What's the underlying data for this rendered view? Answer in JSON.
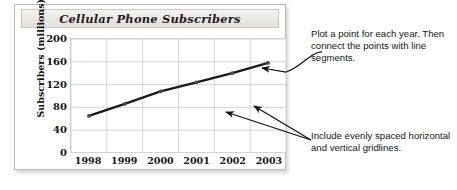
{
  "chart_data": {
    "type": "line",
    "title": "Cellular Phone Subscribers",
    "xlabel": "",
    "ylabel": "Subscribers (millions)",
    "categories": [
      "1998",
      "1999",
      "2000",
      "2001",
      "2002",
      "2003"
    ],
    "values": [
      65,
      86,
      108,
      124,
      140,
      158
    ],
    "ylim": [
      0,
      200
    ],
    "yticks": [
      200,
      160,
      120,
      80,
      40,
      0
    ],
    "grid": "both",
    "gridlines_horizontal": 6,
    "gridlines_vertical": 7,
    "legend": "none",
    "series_color": "#1a1a1a",
    "marker": "dot",
    "annotations": [
      "Plot a point for each year. Then connect the points with line segments.",
      "Include evenly spaced horizontal and vertical gridlines."
    ]
  },
  "panel": {
    "title": "Cellular Phone Subscribers",
    "y_axis_label": "Subscribers (millions)"
  },
  "notes": {
    "plot_points": "Plot a point for each year. Then connect the points with line segments.",
    "gridlines": "Include evenly spaced horizontal and vertical gridlines."
  },
  "colors": {
    "line": "#1a1a1a",
    "grid": "#d4d4d4",
    "panel_border": "#b9b9b9",
    "text": "#161616"
  }
}
